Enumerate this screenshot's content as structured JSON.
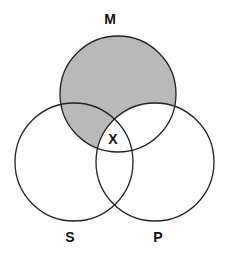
{
  "diagram": {
    "type": "venn-3",
    "sets": [
      {
        "name": "M",
        "label": "M",
        "cx": 118,
        "cy": 94,
        "r": 58
      },
      {
        "name": "S",
        "label": "S",
        "cx": 74,
        "cy": 162,
        "r": 59
      },
      {
        "name": "P",
        "label": "P",
        "cx": 155,
        "cy": 162,
        "r": 59
      }
    ],
    "shaded_regions": [
      "M only",
      "M and S not P"
    ],
    "marked_region": {
      "region": "M and S and P",
      "mark": "X"
    },
    "colors": {
      "shade": "#b9b9b9",
      "stroke": "#222222",
      "background": "#ffffff"
    }
  },
  "labels": {
    "m": "M",
    "s": "S",
    "p": "P",
    "x": "X"
  }
}
